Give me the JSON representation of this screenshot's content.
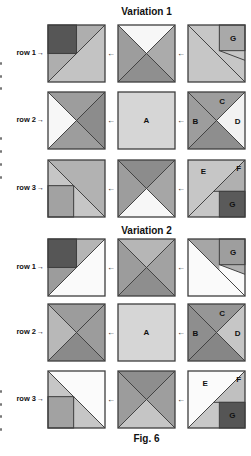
{
  "page": {
    "background": "#ffffff"
  },
  "colors": {
    "line": "#3f3f3f",
    "text": "#111111",
    "fragment": "#787878"
  },
  "figure": {
    "caption": "Fig. 6",
    "row_arrow": "→",
    "connector": "←",
    "variations": [
      {
        "title": "Variation 1",
        "rows": [
          {
            "label": "row 1",
            "blocks": [
              {
                "type": "corner",
                "fills": {
                  "dark": "#565656",
                  "upper": "#aeaeae",
                  "strip": "#aeaeae",
                  "lower": "#c3c3c3"
                }
              },
              {
                "type": "x",
                "fills": {
                  "top": "#f7f7f7",
                  "left": "#9d9d9d",
                  "right": "#ababab",
                  "bottom": "#8f8f8f"
                }
              },
              {
                "type": "gcorner",
                "fills": {
                  "bg": "#c6c6c6",
                  "tl": "#c6c6c6",
                  "sliver": "#c6c6c6",
                  "g": "#a9a9a9"
                },
                "labels": [
                  {
                    "text": "G",
                    "x": 79,
                    "y": 28
                  }
                ]
              }
            ]
          },
          {
            "label": "row 2",
            "blocks": [
              {
                "type": "x",
                "fills": {
                  "top": "#9d9d9d",
                  "left": "#f7f7f7",
                  "right": "#8c8c8c",
                  "bottom": "#9d9d9d"
                }
              },
              {
                "type": "plain",
                "fills": {
                  "bg": "#d6d6d6"
                },
                "labels": [
                  {
                    "text": "A",
                    "x": 50,
                    "y": 55
                  }
                ]
              },
              {
                "type": "x",
                "fills": {
                  "top": "#9d9d9d",
                  "left": "#9d9d9d",
                  "right": "#f2f2f2",
                  "bottom": "#8e8e8e"
                },
                "labels": [
                  {
                    "text": "C",
                    "x": 60,
                    "y": 21
                  },
                  {
                    "text": "B",
                    "x": 13,
                    "y": 56
                  },
                  {
                    "text": "D",
                    "x": 87,
                    "y": 56
                  }
                ]
              }
            ]
          },
          {
            "label": "row 3",
            "blocks": [
              {
                "type": "ssquare",
                "fills": {
                  "upper": "#b2b2b2",
                  "lower": "#c6c6c6",
                  "sq": "#a2a2a2"
                }
              },
              {
                "type": "x",
                "fills": {
                  "top": "#8c8c8c",
                  "left": "#9d9d9d",
                  "right": "#a6a6a6",
                  "bottom": "#f7f7f7"
                }
              },
              {
                "type": "efg",
                "fills": {
                  "e": "#c6c6c6",
                  "f": "#b0b0b0",
                  "quad": "#c6c6c6",
                  "g": "#5a5a5a"
                },
                "labels": [
                  {
                    "text": "E",
                    "x": 27,
                    "y": 25
                  },
                  {
                    "text": "F",
                    "x": 89,
                    "y": 20
                  },
                  {
                    "text": "G",
                    "x": 78,
                    "y": 83
                  }
                ]
              }
            ]
          }
        ]
      },
      {
        "title": "Variation 2",
        "rows": [
          {
            "label": "row 1",
            "blocks": [
              {
                "type": "corner",
                "fills": {
                  "dark": "#565656",
                  "upper": "#b5b5b5",
                  "strip": "#9c9c9c",
                  "lower": "#fafafa"
                }
              },
              {
                "type": "x",
                "fills": {
                  "top": "#b6b6b6",
                  "left": "#9c9c9c",
                  "right": "#a2a2a2",
                  "bottom": "#8e8e8e"
                }
              },
              {
                "type": "gcorner",
                "fills": {
                  "bg": "#fafafa",
                  "tl": "#a6a6a6",
                  "sliver": "#b0b0b0",
                  "g": "#9e9e9e"
                },
                "labels": [
                  {
                    "text": "G",
                    "x": 79,
                    "y": 28
                  }
                ]
              }
            ]
          },
          {
            "label": "row 2",
            "blocks": [
              {
                "type": "x",
                "fills": {
                  "top": "#9c9c9c",
                  "left": "#b8b8b8",
                  "right": "#9c9c9c",
                  "bottom": "#8a8a8a"
                }
              },
              {
                "type": "plain",
                "fills": {
                  "bg": "#d6d6d6"
                },
                "labels": [
                  {
                    "text": "A",
                    "x": 50,
                    "y": 55
                  }
                ]
              },
              {
                "type": "x",
                "fills": {
                  "top": "#969696",
                  "left": "#8e8e8e",
                  "right": "#c6c6c6",
                  "bottom": "#868686"
                },
                "labels": [
                  {
                    "text": "C",
                    "x": 60,
                    "y": 21
                  },
                  {
                    "text": "B",
                    "x": 13,
                    "y": 56
                  },
                  {
                    "text": "D",
                    "x": 87,
                    "y": 56
                  }
                ]
              }
            ]
          },
          {
            "label": "row 3",
            "blocks": [
              {
                "type": "ssquare",
                "fills": {
                  "upper": "#fbfbfb",
                  "lower": "#c6c6c6",
                  "sq": "#a2a2a2"
                }
              },
              {
                "type": "x",
                "fills": {
                  "top": "#8e8e8e",
                  "left": "#9c9c9c",
                  "right": "#9e9e9e",
                  "bottom": "#c5c5c5"
                }
              },
              {
                "type": "efg",
                "fills": {
                  "e": "#fbfbfb",
                  "f": "#c0c0c0",
                  "quad": "#c8c8c8",
                  "g": "#555555"
                },
                "labels": [
                  {
                    "text": "E",
                    "x": 30,
                    "y": 27
                  },
                  {
                    "text": "F",
                    "x": 89,
                    "y": 20
                  },
                  {
                    "text": "G",
                    "x": 78,
                    "y": 83
                  }
                ]
              }
            ]
          }
        ]
      }
    ]
  },
  "margin_fragments": {
    "positions_y": [
      62,
      75,
      87,
      137,
      150,
      163,
      176,
      390,
      403,
      415,
      428
    ]
  }
}
